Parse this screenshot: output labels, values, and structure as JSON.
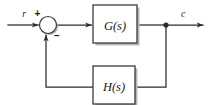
{
  "diagram": {
    "kind": "control-system-block-diagram",
    "background_color": "#ffffff",
    "line_color": "#2b2b2b",
    "box_fill_color": "#ffffff",
    "box_border_color": "#3a3a3a",
    "shadow_color": "#b8b8b8",
    "text_color": "#1a1a1a"
  },
  "signals": {
    "input_label": "r",
    "output_label": "c"
  },
  "summing_junction": {
    "name": "summing-junction",
    "positive_sign": "+",
    "negative_sign": "−",
    "cx": 48,
    "cy": 25,
    "r": 8.5
  },
  "blocks": [
    {
      "id": "forward-block",
      "label": "G(s)",
      "x": 93,
      "y": 5,
      "width": 44,
      "height": 38
    },
    {
      "id": "feedback-block",
      "label": "H(s)",
      "x": 93,
      "y": 66,
      "width": 42,
      "height": 38
    }
  ],
  "junction_node": {
    "name": "output-takeoff-node",
    "cx": 166,
    "cy": 24,
    "r": 2.4
  },
  "paths": {
    "input_wire": "input r into summing junction",
    "forward_wire": "summing junction into G(s)",
    "output_wire": "G(s) to takeoff node to output c",
    "feedback_down": "takeoff node down to feedback row",
    "feedback_into_h": "right side into H(s)",
    "feedback_out_h": "H(s) left to riser",
    "feedback_up": "riser up into summing junction"
  }
}
